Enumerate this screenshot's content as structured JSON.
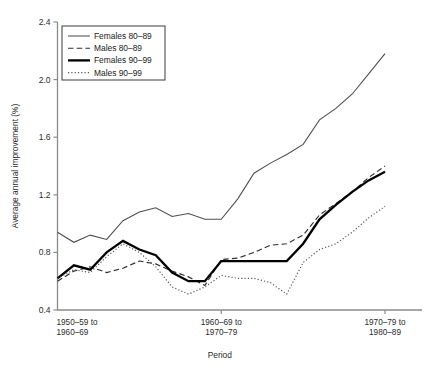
{
  "chart_data": {
    "type": "line",
    "title": "",
    "xlabel": "Period",
    "ylabel": "Average annual improvement (%)",
    "ylim": [
      0.4,
      2.4
    ],
    "ytick_labels": [
      "0.4",
      "0.8",
      "1.2",
      "1.6",
      "2.0",
      "2.4"
    ],
    "ytick_values": [
      0.4,
      0.8,
      1.2,
      1.6,
      2.0,
      2.4
    ],
    "grid": false,
    "legend_position": "top-left",
    "xtick_labels": [
      "1950–59 to\n1960–69",
      "1960–69 to\n1970–79",
      "1970–79 to\n1980–89"
    ],
    "xtick_labels_line1": [
      "1950–59 to",
      "1960–69 to",
      "1970–79 to"
    ],
    "xtick_labels_line2": [
      "1960–69",
      "1970–79",
      "1980–89"
    ],
    "xtick_indices": [
      0,
      10,
      20
    ],
    "x": [
      0,
      1,
      2,
      3,
      4,
      5,
      6,
      7,
      8,
      9,
      10,
      11,
      12,
      13,
      14,
      15,
      16,
      17,
      18,
      19,
      20
    ],
    "series": [
      {
        "name": "Females 80–89",
        "style": "thin-solid",
        "color": "#4d4d4d",
        "values": [
          0.94,
          0.87,
          0.92,
          0.89,
          1.02,
          1.08,
          1.11,
          1.05,
          1.07,
          1.03,
          1.03,
          1.17,
          1.35,
          1.42,
          1.48,
          1.55,
          1.72,
          1.8,
          1.9,
          2.04,
          2.18
        ]
      },
      {
        "name": "Males 80–89",
        "style": "dashed",
        "color": "#2e2e2e",
        "values": [
          0.6,
          0.67,
          0.7,
          0.66,
          0.69,
          0.74,
          0.72,
          0.67,
          0.63,
          0.57,
          0.75,
          0.76,
          0.8,
          0.85,
          0.86,
          0.92,
          1.06,
          1.14,
          1.22,
          1.32,
          1.4
        ]
      },
      {
        "name": "Females 90–99",
        "style": "thick-solid",
        "color": "#000000",
        "values": [
          0.62,
          0.71,
          0.68,
          0.8,
          0.88,
          0.82,
          0.78,
          0.66,
          0.6,
          0.6,
          0.74,
          0.74,
          0.74,
          0.74,
          0.74,
          0.86,
          1.03,
          1.13,
          1.22,
          1.3,
          1.36
        ]
      },
      {
        "name": "Males 90–99",
        "style": "dotted",
        "color": "#555555",
        "values": [
          0.62,
          0.68,
          0.66,
          0.77,
          0.86,
          0.8,
          0.7,
          0.56,
          0.51,
          0.56,
          0.64,
          0.62,
          0.62,
          0.59,
          0.51,
          0.73,
          0.82,
          0.86,
          0.94,
          1.04,
          1.12
        ]
      }
    ]
  },
  "legend": {
    "entries": [
      {
        "label": "Females 80–89"
      },
      {
        "label": "Males 80–89"
      },
      {
        "label": "Females 90–99"
      },
      {
        "label": "Males 90–99"
      }
    ]
  }
}
